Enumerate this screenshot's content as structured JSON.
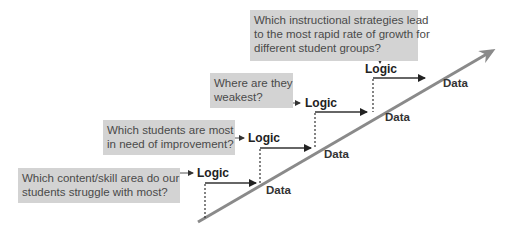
{
  "diagram": {
    "type": "staircase-logic-data",
    "colors": {
      "question_box_bg": "#d3d3d3",
      "question_text": "#4a4a4a",
      "diagonal_arrow": "#8a8a8a",
      "step_lines": "#333333"
    },
    "steps": [
      {
        "question_lines": [
          "Which content/skill area do our",
          "students struggle with most?"
        ],
        "logic_label": "Logic",
        "data_label": "Data"
      },
      {
        "question_lines": [
          "Which students are most",
          "in need of improvement?"
        ],
        "logic_label": "Logic",
        "data_label": "Data"
      },
      {
        "question_lines": [
          "Where are they",
          "weakest?"
        ],
        "logic_label": "Logic",
        "data_label": "Data"
      },
      {
        "question_lines": [
          "Which instructional strategies lead",
          "to the most rapid rate of growth for",
          "different student groups?"
        ],
        "logic_label": "Logic",
        "data_label": "Data"
      }
    ]
  }
}
